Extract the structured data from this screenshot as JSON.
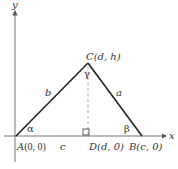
{
  "diagram": {
    "type": "triangle-in-coordinate-plane",
    "axes": {
      "x_label": "x",
      "y_label": "y"
    },
    "vertices": {
      "A": {
        "label_name": "A",
        "label_coords": "(0, 0)"
      },
      "B": {
        "label_name": "B",
        "label_coords": "(c, 0)"
      },
      "C": {
        "label_name": "C",
        "label_coords": "(d, h)"
      },
      "D": {
        "label_name": "D",
        "label_coords": "(d, 0)"
      }
    },
    "sides": {
      "a": "a",
      "b": "b",
      "c": "c"
    },
    "angles": {
      "alpha": "α",
      "beta": "β",
      "gamma": "γ"
    },
    "colors": {
      "stroke": "#222222",
      "dashed": "#888888",
      "text": "#333333"
    }
  }
}
